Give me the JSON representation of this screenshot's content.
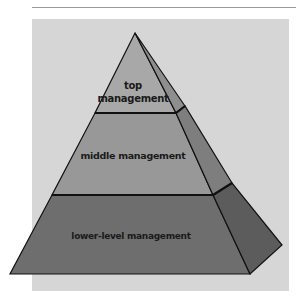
{
  "diagram": {
    "type": "pyramid",
    "levels": [
      {
        "id": "top",
        "label_line1": "top",
        "label_line2": "management"
      },
      {
        "id": "middle",
        "label": "middle management"
      },
      {
        "id": "lower",
        "label": "lower-level management"
      }
    ],
    "colors": {
      "background_panel": "#d6d6d6",
      "top_front": "#a8a8a8",
      "top_side": "#8e8e8e",
      "middle_front": "#989898",
      "middle_side": "#7e7e7e",
      "lower_front": "#6e6e6e",
      "lower_side": "#5c5c5c",
      "outline": "#111111"
    }
  }
}
